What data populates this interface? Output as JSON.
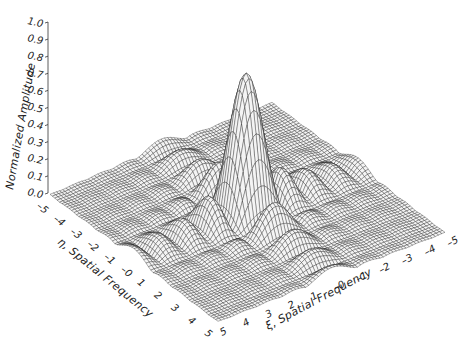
{
  "chart_data": {
    "type": "surface3d",
    "title": "",
    "zlabel": "Normalized Amplitude",
    "xlabel": "ξ, Spatial Frequency",
    "ylabel": "η, Spatial Frequency",
    "zlim": [
      0.0,
      1.0
    ],
    "xlim": [
      -5,
      5
    ],
    "ylim": [
      -5,
      5
    ],
    "z_ticks": [
      "0.0",
      "0.1",
      "0.2",
      "0.3",
      "0.4",
      "0.5",
      "0.6",
      "0.7",
      "0.8",
      "0.9",
      "1.0"
    ],
    "x_ticks": [
      "5",
      "4",
      "3",
      "2",
      "1",
      "–0",
      "–1",
      "–2",
      "–3",
      "–4",
      "–5"
    ],
    "y_ticks": [
      "–5",
      "–4",
      "–3",
      "–2",
      "–1",
      "–0",
      "1",
      "2",
      "3",
      "4",
      "5"
    ],
    "function": "normalized |sinc(ξ)·sinc(η)| amplitude (separable rectangular aperture)",
    "peak": {
      "xi": 0,
      "eta": 0,
      "amplitude": 0.82
    },
    "side_lobes": [
      {
        "xi": 1.43,
        "eta": 0,
        "amplitude": 0.22
      },
      {
        "xi": -1.43,
        "eta": 0,
        "amplitude": 0.22
      },
      {
        "xi": 0,
        "eta": 1.43,
        "amplitude": 0.22
      },
      {
        "xi": 0,
        "eta": -1.43,
        "amplitude": 0.22
      }
    ],
    "grid": false,
    "legend": null,
    "colors": {
      "mesh": "#1a1a1a",
      "background": "#ffffff"
    }
  }
}
